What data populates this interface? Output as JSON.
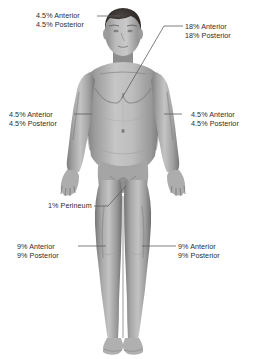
{
  "diagram": {
    "background_color": "#ffffff",
    "label_color": "#2b2b2b",
    "leader_line_color": "#5d5d5d",
    "skin_tones": {
      "highlight": "#cfcfcf",
      "midtone": "#a6a6a6",
      "shadow": "#7d7d7d",
      "deep_shadow": "#5c5c5c",
      "hair": "#2e2a28"
    }
  },
  "labels": {
    "head": {
      "name": "head-label",
      "line1": "4.5% Anterior",
      "line2": "4.5% Posterior"
    },
    "trunk": {
      "name": "trunk-label",
      "line1": "18% Anterior",
      "line2": "18% Posterior"
    },
    "arm_left": {
      "name": "left-arm-label",
      "line1": "4.5% Anterior",
      "line2": "4.5% Posterior"
    },
    "arm_right": {
      "name": "right-arm-label",
      "line1": "4.5% Anterior",
      "line2": "4.5% Posterior"
    },
    "perineum": {
      "name": "perineum-label",
      "line1": "1% Perineum"
    },
    "leg_left": {
      "name": "left-leg-label",
      "line1": "9% Anterior",
      "line2": "9% Posterior"
    },
    "leg_right": {
      "name": "right-leg-label",
      "line1": "9% Anterior",
      "line2": "9% Posterior"
    }
  }
}
